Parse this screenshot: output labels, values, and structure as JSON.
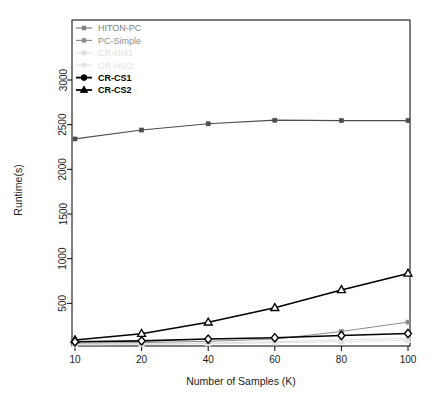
{
  "chart_data": {
    "type": "line",
    "title": "",
    "xlabel": "Number of Samples (K)",
    "ylabel": "Runtime(s)",
    "categories": [
      "10",
      "20",
      "40",
      "60",
      "80",
      "100"
    ],
    "x": [
      10,
      20,
      40,
      60,
      80,
      100
    ],
    "xtick_labels": [
      "10",
      "20",
      "40",
      "60",
      "80",
      "100"
    ],
    "ytick_labels": [
      "500",
      "1000",
      "1500",
      "2000",
      "2500",
      "3000"
    ],
    "ytick_values": [
      500,
      1000,
      1500,
      2000,
      2500,
      3000
    ],
    "ylim": [
      0,
      3120
    ],
    "grid": false,
    "legend_position": "top-left",
    "series": [
      {
        "name": "HITON-PC",
        "color": "#4d4d4d",
        "marker": "filled-square",
        "values": [
          2340,
          2440,
          2510,
          2550,
          2545,
          2545
        ]
      },
      {
        "name": "PC-Simple",
        "color": "#8c8c8c",
        "marker": "filled-square",
        "values": [
          55,
          60,
          75,
          100,
          185,
          290
        ]
      },
      {
        "name": "CR-HM1",
        "color": "#dcdcdc",
        "marker": "filled-circle",
        "values": [
          40,
          45,
          55,
          70,
          90,
          110
        ]
      },
      {
        "name": "CR-HM2",
        "color": "#e2e2e2",
        "marker": "filled-triangle",
        "values": [
          35,
          40,
          48,
          58,
          70,
          85
        ]
      },
      {
        "name": "CR-CS1",
        "color": "#000000",
        "marker": "open-diamond",
        "values": [
          70,
          80,
          100,
          115,
          140,
          162
        ]
      },
      {
        "name": "CR-CS2",
        "color": "#000000",
        "marker": "open-triangle",
        "values": [
          90,
          160,
          288,
          450,
          650,
          835
        ]
      }
    ]
  },
  "legend": {
    "items": [
      {
        "label": "HITON-PC",
        "color": "#808080",
        "bold": false
      },
      {
        "label": "PC-Simple",
        "color": "#8f8f8f",
        "bold": false
      },
      {
        "label": "CR-HM1",
        "color": "#e0e0e0",
        "bold": false
      },
      {
        "label": "CR-HM2",
        "color": "#e4e4e4",
        "bold": false
      },
      {
        "label": "CR-CS1",
        "color": "#000000",
        "bold": true
      },
      {
        "label": "CR-CS2",
        "color": "#000000",
        "bold": true
      }
    ]
  }
}
